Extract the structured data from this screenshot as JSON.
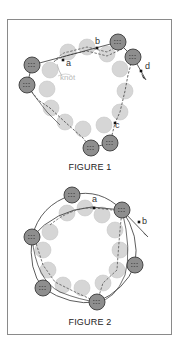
{
  "colors": {
    "light_bead_fill": "#d6d6d6",
    "light_bead_stroke": "#c8c8c8",
    "dark_bead_fill": "#8e8e8e",
    "dark_bead_stroke": "#3a3a3a",
    "thread": "#333333",
    "dashed_thread": "#555555",
    "frame": "#8a8a8a",
    "knot_label": "#b8b8b8"
  },
  "figures": [
    {
      "caption": "FIGURE 1",
      "caption_pos": [
        90,
        170
      ],
      "light_beads": [
        [
          50,
          70
        ],
        [
          47,
          89
        ],
        [
          51,
          108
        ],
        [
          65,
          122
        ],
        [
          83,
          129
        ],
        [
          104,
          125
        ],
        [
          120,
          112
        ],
        [
          125,
          91
        ],
        [
          120,
          69
        ],
        [
          107,
          54
        ],
        [
          87,
          47
        ],
        [
          68,
          52
        ]
      ],
      "dark_beads": [
        [
          32,
          65
        ],
        [
          27,
          85
        ],
        [
          91,
          148
        ],
        [
          110,
          143
        ],
        [
          118,
          42
        ],
        [
          133,
          57
        ]
      ],
      "labels": [
        {
          "text": "a",
          "pos": [
            66,
            66
          ],
          "dot": [
            63,
            60
          ]
        },
        {
          "text": "b",
          "pos": [
            95,
            44
          ],
          "dot": [
            97,
            48
          ]
        },
        {
          "text": "c",
          "pos": [
            115,
            128
          ],
          "dot": [
            115,
            123
          ]
        },
        {
          "text": "d",
          "pos": [
            145,
            69
          ],
          "dot": [
            141,
            71
          ]
        }
      ],
      "knot_label": "knot",
      "knot_pos": [
        60,
        80
      ]
    },
    {
      "caption": "FIGURE 2",
      "caption_pos": [
        90,
        325
      ],
      "light_beads": [
        [
          67,
          213
        ],
        [
          85,
          208
        ],
        [
          102,
          215
        ],
        [
          115,
          230
        ],
        [
          120,
          250
        ],
        [
          117,
          270
        ],
        [
          103,
          283
        ],
        [
          82,
          288
        ],
        [
          63,
          285
        ],
        [
          48,
          270
        ],
        [
          43,
          250
        ],
        [
          50,
          232
        ]
      ],
      "dark_beads": [
        [
          72,
          195
        ],
        [
          122,
          210
        ],
        [
          32,
          237
        ],
        [
          135,
          265
        ],
        [
          43,
          288
        ],
        [
          97,
          302
        ]
      ],
      "labels": [
        {
          "text": "a",
          "pos": [
            92,
            202
          ],
          "dot": [
            94,
            208
          ]
        },
        {
          "text": "b",
          "pos": [
            142,
            224
          ],
          "dot": [
            139,
            222
          ]
        }
      ]
    }
  ]
}
